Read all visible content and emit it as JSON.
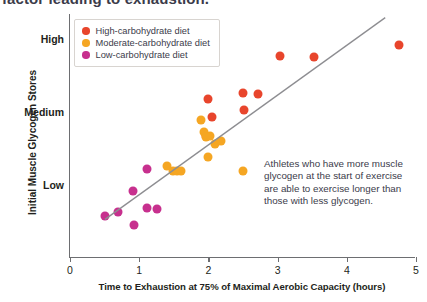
{
  "title_sliver": "factor leading to exhaustion.",
  "chart_data": {
    "type": "scatter",
    "title": "",
    "xlabel": "Time to Exhaustion at 75% of Maximal Aerobic Capacity (hours)",
    "ylabel": "Initial Muscle Glycogen Stores",
    "xlim": [
      0,
      5
    ],
    "ylim": [
      0,
      3.35
    ],
    "grid": false,
    "legend_position": "top-left",
    "xticks": [
      {
        "value": 0,
        "label": "0"
      },
      {
        "value": 1,
        "label": "1"
      },
      {
        "value": 2,
        "label": "2"
      },
      {
        "value": 3,
        "label": "3"
      },
      {
        "value": 4,
        "label": "4"
      },
      {
        "value": 5,
        "label": "5"
      }
    ],
    "yticks": [
      {
        "value": 1.0,
        "label": "Low"
      },
      {
        "value": 2.0,
        "label": "Medium"
      },
      {
        "value": 3.0,
        "label": "High"
      }
    ],
    "trendline": {
      "x0": 0.52,
      "y0": 0.53,
      "x1": 4.57,
      "y1": 3.3,
      "color": "#8d8d91"
    },
    "annotation": "Athletes who have more muscle glycogen at the start of exercise are able to exercise longer than those with less glycogen.",
    "series": [
      {
        "name": "High-carbohydrate diet",
        "color": "#E8452C",
        "points": [
          {
            "x": 1.99,
            "y": 2.18
          },
          {
            "x": 2.05,
            "y": 1.93
          },
          {
            "x": 2.5,
            "y": 2.26
          },
          {
            "x": 2.71,
            "y": 2.25
          },
          {
            "x": 2.52,
            "y": 2.03
          },
          {
            "x": 1.97,
            "y": 1.68
          },
          {
            "x": 3.03,
            "y": 2.78
          },
          {
            "x": 3.52,
            "y": 2.76
          },
          {
            "x": 4.76,
            "y": 2.93
          }
        ]
      },
      {
        "name": "Moderate-carbohydrate diet",
        "color": "#F5A623",
        "points": [
          {
            "x": 1.4,
            "y": 1.26
          },
          {
            "x": 1.49,
            "y": 1.2
          },
          {
            "x": 1.55,
            "y": 1.19
          },
          {
            "x": 1.6,
            "y": 1.19
          },
          {
            "x": 1.9,
            "y": 1.89
          },
          {
            "x": 1.94,
            "y": 1.73
          },
          {
            "x": 1.97,
            "y": 1.66
          },
          {
            "x": 2.03,
            "y": 1.67
          },
          {
            "x": 2.1,
            "y": 1.57
          },
          {
            "x": 1.99,
            "y": 1.38
          },
          {
            "x": 2.18,
            "y": 1.6
          },
          {
            "x": 2.5,
            "y": 1.19
          }
        ]
      },
      {
        "name": "Low-carbohydrate diet",
        "color": "#C7308E",
        "points": [
          {
            "x": 0.5,
            "y": 0.58
          },
          {
            "x": 0.69,
            "y": 0.63
          },
          {
            "x": 0.91,
            "y": 0.92
          },
          {
            "x": 0.92,
            "y": 0.45
          },
          {
            "x": 1.11,
            "y": 1.22
          },
          {
            "x": 1.11,
            "y": 0.68
          },
          {
            "x": 1.26,
            "y": 0.67
          }
        ]
      }
    ]
  }
}
